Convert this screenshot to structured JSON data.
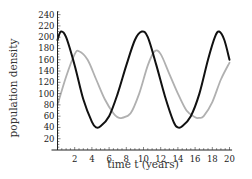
{
  "chart_data": {
    "type": "line",
    "title": "",
    "xlabel": "time t (years)",
    "ylabel": "population density",
    "xlim": [
      0,
      20
    ],
    "ylim": [
      0,
      245
    ],
    "x_ticks": [
      2,
      4,
      6,
      8,
      10,
      12,
      14,
      16,
      18,
      20
    ],
    "y_ticks": [
      20,
      40,
      60,
      80,
      100,
      120,
      140,
      160,
      180,
      200,
      220,
      240
    ],
    "grid": false,
    "legend": null,
    "series": [
      {
        "name": "predator-prey population A (black)",
        "color": "#111111",
        "x": [
          0,
          0.4,
          1,
          2,
          3,
          4,
          4.5,
          5,
          6,
          7,
          8,
          9,
          9.8,
          10.5,
          11.5,
          12.5,
          13.5,
          14,
          14.5,
          15.5,
          16.5,
          17.5,
          18.3,
          18.8,
          19.4,
          20
        ],
        "y": [
          195,
          210,
          200,
          150,
          90,
          50,
          40,
          42,
          60,
          100,
          150,
          195,
          210,
          200,
          150,
          95,
          50,
          40,
          42,
          60,
          100,
          160,
          200,
          210,
          195,
          160
        ]
      },
      {
        "name": "predator-prey population B (gray)",
        "color": "#b0b0b0",
        "x": [
          0,
          1,
          2,
          2.5,
          3.5,
          4.5,
          5.5,
          6.5,
          7,
          7.5,
          8.5,
          9.5,
          10.5,
          11.3,
          12,
          13,
          14,
          15,
          16,
          16.5,
          17,
          18,
          19,
          20
        ],
        "y": [
          80,
          130,
          170,
          175,
          160,
          125,
          90,
          65,
          58,
          57,
          65,
          100,
          150,
          175,
          170,
          135,
          100,
          70,
          58,
          57,
          60,
          85,
          125,
          155
        ]
      }
    ]
  },
  "labels": {
    "xlabel": "time t (years)",
    "ylabel": "population density"
  }
}
